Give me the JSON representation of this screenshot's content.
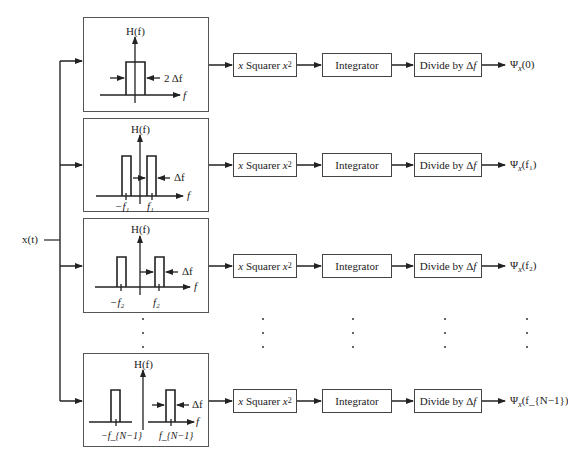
{
  "input": {
    "label": "x(t)"
  },
  "filter_axis_label": "H(f)",
  "freq_axis_label": "f",
  "blocks": {
    "squarer": {
      "pre": "x",
      "name": "Squarer",
      "post": "x",
      "post_sup": "2"
    },
    "integrator": "Integrator",
    "divider": {
      "text": "Divide by Δ",
      "var": "f"
    }
  },
  "branches": [
    {
      "id": "0",
      "bandwidth_label": "2 Δf",
      "neg_freq": "",
      "pos_freq": "",
      "output": {
        "psi": "Ψ",
        "sub": "x",
        "arg": "(0)"
      }
    },
    {
      "id": "1",
      "bandwidth_label": "Δf",
      "neg_freq": "−f₁",
      "pos_freq": "f₁",
      "output": {
        "psi": "Ψ",
        "sub": "x",
        "arg": "(f₁)"
      }
    },
    {
      "id": "2",
      "bandwidth_label": "Δf",
      "neg_freq": "−f₂",
      "pos_freq": "f₂",
      "output": {
        "psi": "Ψ",
        "sub": "x",
        "arg": "(f₂)"
      }
    },
    {
      "id": "N-1",
      "bandwidth_label": "Δf",
      "neg_freq": "−f_{N−1}",
      "pos_freq": "f_{N−1}",
      "output": {
        "psi": "Ψ",
        "sub": "x",
        "arg": "(f_{N−1})"
      }
    }
  ],
  "ellipsis": "⋮"
}
